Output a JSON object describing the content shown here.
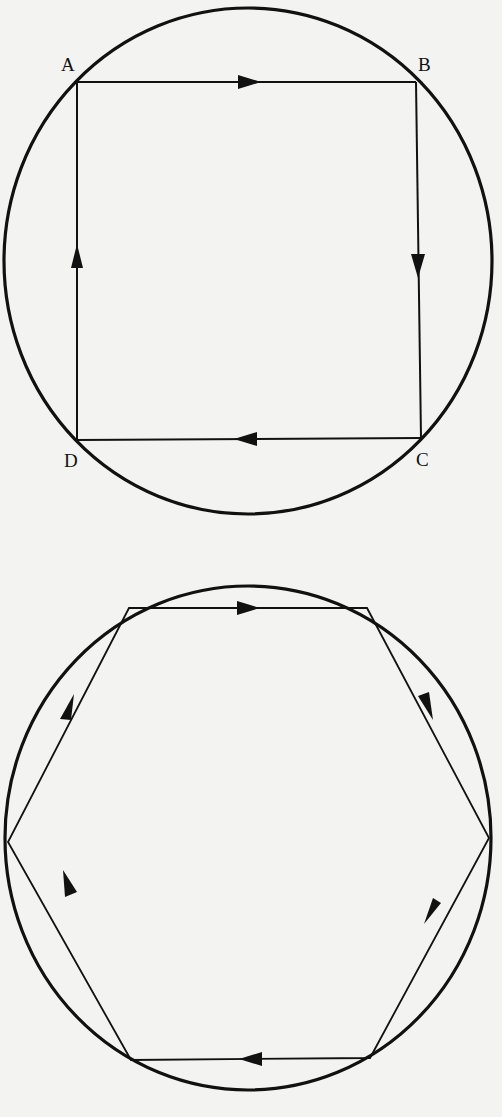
{
  "colors": {
    "background": "#f3f3f1",
    "ink": "#111111"
  },
  "figures": [
    {
      "id": "square-in-circle",
      "shape": "square",
      "circle": {
        "cx": 248,
        "cy": 261,
        "rx": 244,
        "ry": 253
      },
      "vertices": [
        {
          "label": "A",
          "x": 77,
          "y": 82
        },
        {
          "label": "B",
          "x": 416,
          "y": 82
        },
        {
          "label": "C",
          "x": 421,
          "y": 438
        },
        {
          "label": "D",
          "x": 77,
          "y": 440
        }
      ],
      "labels": {
        "a": "A",
        "b": "B",
        "c": "C",
        "d": "D"
      },
      "direction": "clockwise"
    },
    {
      "id": "hexagon-in-circle",
      "shape": "hexagon",
      "circle": {
        "cx": 248,
        "cy": 318,
        "rx": 243,
        "ry": 252
      },
      "vertices": [
        {
          "x": 129,
          "y": 88
        },
        {
          "x": 367,
          "y": 88
        },
        {
          "x": 489,
          "y": 318
        },
        {
          "x": 370,
          "y": 538
        },
        {
          "x": 131,
          "y": 540
        },
        {
          "x": 8,
          "y": 322
        }
      ],
      "direction": "clockwise"
    }
  ]
}
